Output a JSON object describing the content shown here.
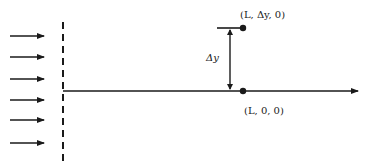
{
  "diagram": {
    "type": "flow-schematic",
    "colors": {
      "ink": "#1a1a1a",
      "background": "#ffffff"
    },
    "incoming_flow_arrows": {
      "count": 6,
      "direction": "right"
    },
    "boundary": {
      "style": "dashed",
      "orientation": "vertical"
    },
    "axis": {
      "orientation": "horizontal",
      "direction": "right"
    },
    "points": [
      {
        "id": "origin-point",
        "label": "(L, 0, 0)"
      },
      {
        "id": "offset-point",
        "label": "(L, Δy, 0)"
      }
    ],
    "dimension": {
      "label": "Δy"
    }
  }
}
